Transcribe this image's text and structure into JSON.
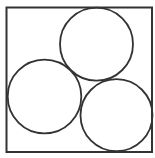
{
  "diagram": {
    "canvas": {
      "width": 155,
      "height": 158,
      "background": "#ffffff"
    },
    "stroke_color": "#333333",
    "square": {
      "x": 6.5,
      "y": 7.5,
      "width": 145.5,
      "height": 144.5,
      "stroke_width": 2
    },
    "circles": [
      {
        "name": "top-circle",
        "cx": 96.5,
        "cy": 44.2,
        "r": 36.5
      },
      {
        "name": "left-circle",
        "cx": 44.5,
        "cy": 96.5,
        "r": 36.8
      },
      {
        "name": "bottom-right-circle",
        "cx": 116.5,
        "cy": 115.2,
        "r": 36
      }
    ],
    "circle_stroke_width": 1.8
  }
}
